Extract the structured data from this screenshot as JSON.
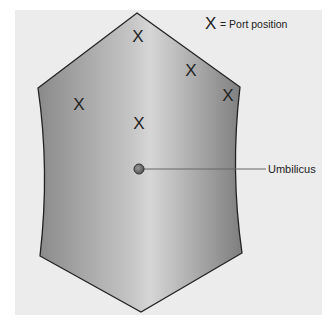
{
  "legend": {
    "symbol": "X",
    "text": "= Port position"
  },
  "labels": {
    "umbilicus": "Umbilicus"
  },
  "ports": [
    {
      "symbol": "X",
      "x": 138,
      "y": 36
    },
    {
      "symbol": "X",
      "x": 191,
      "y": 70
    },
    {
      "symbol": "X",
      "x": 228,
      "y": 95
    },
    {
      "symbol": "X",
      "x": 79,
      "y": 104
    },
    {
      "symbol": "X",
      "x": 139,
      "y": 123
    }
  ],
  "colors": {
    "panel": "#ececec",
    "shape_edge": "#888888",
    "shape_center": "#dcdcdc",
    "outline": "#222222",
    "umbilicus": "#777777"
  }
}
